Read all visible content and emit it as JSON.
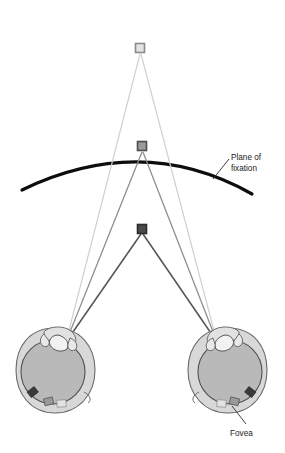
{
  "figure": {
    "type": "diagram",
    "background_color": "#ffffff"
  },
  "labels": {
    "plane_of_fixation_line1": "Plane of",
    "plane_of_fixation_line2": "fixation",
    "fovea": "Fovea"
  },
  "colors": {
    "arc": "#0d0d0d",
    "far_ray": "#cfcfcf",
    "fixation_ray": "#8c8c8c",
    "near_ray": "#555555",
    "far_square_fill": "#e3e3e3",
    "far_square_stroke": "#8a8a8a",
    "fixation_square_fill": "#9a9a9a",
    "fixation_square_stroke": "#4d4d4d",
    "near_square_fill": "#4a4a4a",
    "near_square_stroke": "#2b2b2b",
    "eye_outline": "#6b6b6b",
    "eye_fill": "#d8d8d8",
    "vitreous_fill": "#b9b9b9",
    "retina_marker_dark": "#3a3a3a",
    "retina_marker_mid": "#8f8f8f",
    "retina_marker_light": "#d0d0d0",
    "label_text": "#1a1a1a",
    "leader_line": "#2a2a2a"
  },
  "targets": [
    {
      "name": "far-target",
      "shape": "square",
      "x": 140,
      "y": 48,
      "size": 9,
      "tone": "light"
    },
    {
      "name": "fixation-target",
      "shape": "square",
      "x": 142,
      "y": 146,
      "size": 9,
      "tone": "medium"
    },
    {
      "name": "near-target",
      "shape": "square",
      "x": 142,
      "y": 229,
      "size": 9,
      "tone": "dark"
    }
  ],
  "eyes": [
    {
      "name": "left-eye",
      "center_x": 55,
      "center_y": 370,
      "nodal_x": 66,
      "nodal_y": 342
    },
    {
      "name": "right-eye",
      "center_x": 228,
      "center_y": 370,
      "nodal_x": 217,
      "nodal_y": 342
    }
  ],
  "arc": {
    "name": "plane-of-fixation-arc",
    "left_end": {
      "x": 22,
      "y": 190
    },
    "apex": {
      "x": 142,
      "y": 146
    },
    "right_end": {
      "x": 252,
      "y": 194
    },
    "stroke_width": 3.2
  },
  "annotations": [
    {
      "name": "plane-of-fixation-annotation",
      "leader_from": {
        "x": 214,
        "y": 178
      },
      "leader_to": {
        "x": 229,
        "y": 160
      },
      "text_x": 232,
      "text_y": 158
    },
    {
      "name": "fovea-annotation",
      "leader_from": {
        "x": 232,
        "y": 405
      },
      "leader_to": {
        "x": 247,
        "y": 423
      },
      "text_x": 231,
      "text_y": 435
    }
  ]
}
